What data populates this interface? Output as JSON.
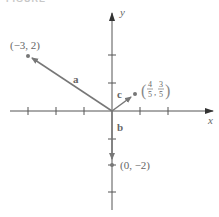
{
  "heading": "FIGURE",
  "axes": {
    "x_label": "x",
    "y_label": "y"
  },
  "origin_px": [
    112,
    111
  ],
  "unit_px": 28,
  "vectors": [
    {
      "name": "a",
      "label": "a",
      "tip": [
        -3,
        2
      ],
      "tip_label": "(−3, 2)"
    },
    {
      "name": "b",
      "label": "b",
      "tip": [
        0,
        -2
      ],
      "tip_label": "(0, −2)"
    },
    {
      "name": "c",
      "label": "c",
      "tip": [
        0.8,
        0.6
      ],
      "tip_label_num1": "4",
      "tip_label_den1": "5",
      "tip_label_num2": "3",
      "tip_label_den2": "5"
    }
  ],
  "ticks": {
    "x": [
      -3,
      -2,
      -1,
      1,
      2
    ],
    "y": [
      -3,
      -2,
      -1,
      1,
      2
    ]
  },
  "colors": {
    "axis": "#555555",
    "vector": "#777777",
    "text": "#666666"
  }
}
